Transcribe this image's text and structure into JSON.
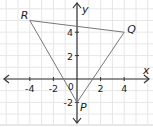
{
  "chart_data": {
    "type": "diagram",
    "title": "",
    "xlabel": "x",
    "ylabel": "y",
    "origin_label": "0",
    "xlim": [
      -6,
      6
    ],
    "ylim": [
      -4,
      6
    ],
    "grid": true,
    "x_ticks": [
      {
        "value": -4,
        "label": "-4"
      },
      {
        "value": -2,
        "label": "-2"
      },
      {
        "value": 2,
        "label": "2"
      },
      {
        "value": 4,
        "label": "4"
      }
    ],
    "y_ticks": [
      {
        "value": 4,
        "label": "4"
      },
      {
        "value": 2,
        "label": "2"
      },
      {
        "value": -2,
        "label": "-2"
      }
    ],
    "shape": "triangle",
    "vertices": [
      {
        "name": "R",
        "x": -4,
        "y": 5
      },
      {
        "name": "Q",
        "x": 4,
        "y": 4
      },
      {
        "name": "P",
        "x": 0,
        "y": -2
      }
    ]
  },
  "colors": {
    "grid": "#e6e6e6",
    "axis": "#333333",
    "triangle": "#777777",
    "border": "#cccccc"
  }
}
